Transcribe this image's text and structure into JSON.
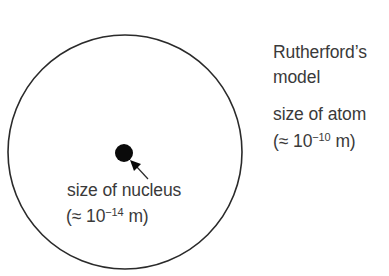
{
  "title": {
    "line1": "Rutherford’s",
    "line2": "model"
  },
  "atom_label": {
    "line1": "size of atom",
    "approx_prefix": "(≈ 10",
    "exponent": "−10",
    "unit_suffix": " m)"
  },
  "nucleus_label": {
    "line1": "size of nucleus",
    "approx_prefix": "(≈ 10",
    "exponent": "−14",
    "unit_suffix": " m)"
  },
  "colors": {
    "stroke": "#2a2a2a",
    "nucleus_fill": "#0a0a0a",
    "text": "#3a3a3a",
    "background": "#ffffff"
  },
  "shapes": {
    "atom_circle": {
      "cx": 125,
      "cy": 152,
      "r": 117
    },
    "nucleus": {
      "cx": 124,
      "cy": 153,
      "r": 9
    },
    "arrow": {
      "from": [
        148,
        179
      ],
      "to": [
        131,
        161
      ]
    }
  }
}
